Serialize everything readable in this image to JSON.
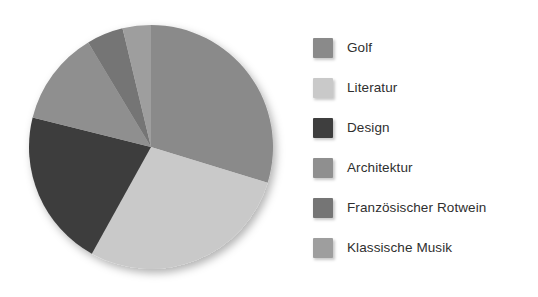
{
  "chart_data": {
    "type": "pie",
    "title": "",
    "subtitle": "",
    "xlabel": "",
    "ylabel": "",
    "grid": false,
    "legend_position": "right",
    "start_angle_deg": 0,
    "direction": "clockwise",
    "categories": [
      "Golf",
      "Literatur",
      "Design",
      "Architektur",
      "Französischer Rotwein",
      "Klassische Musik"
    ],
    "values": [
      29.7,
      28.3,
      20.8,
      12.5,
      4.9,
      3.8
    ],
    "units": "percent",
    "slice_angles_deg": [
      107.0,
      102.0,
      75.0,
      45.0,
      17.5,
      13.5
    ],
    "colors": [
      "#8a8a8a",
      "#c9c9c9",
      "#3e3e3e",
      "#8f8f8f",
      "#757575",
      "#9e9e9e"
    ],
    "series": [
      {
        "name": "Interessen",
        "values": [
          29.7,
          28.3,
          20.8,
          12.5,
          4.9,
          3.8
        ]
      }
    ]
  },
  "legend": {
    "items": [
      {
        "label": "Golf",
        "color": "#8a8a8a"
      },
      {
        "label": "Literatur",
        "color": "#c9c9c9"
      },
      {
        "label": "Design",
        "color": "#3e3e3e"
      },
      {
        "label": "Architektur",
        "color": "#8f8f8f"
      },
      {
        "label": "Französischer Rotwein",
        "color": "#757575"
      },
      {
        "label": "Klassische Musik",
        "color": "#9e9e9e"
      }
    ]
  },
  "pie": {
    "center_x": 151,
    "center_y": 147,
    "radius": 122
  }
}
